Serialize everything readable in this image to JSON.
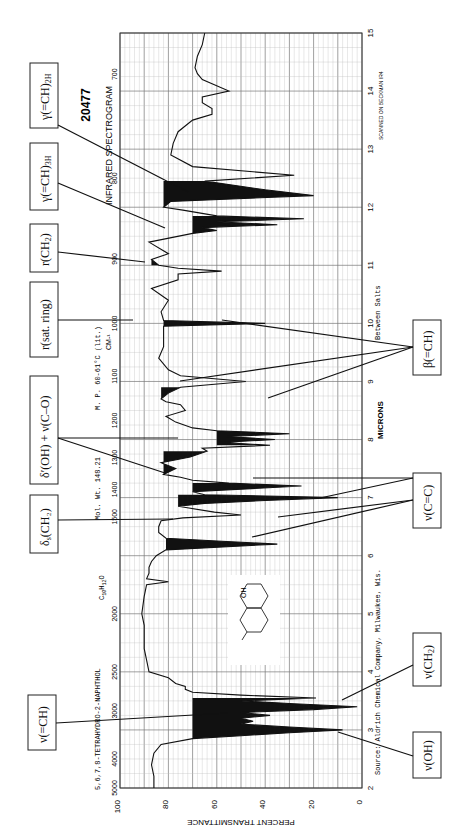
{
  "chart_data": {
    "type": "line",
    "title": "INFRARED SPECTROGRAM",
    "spectrum_id": "20477",
    "compound": "5,6,7,8-TETRAHYDRO-2-NAPHTHOL",
    "formula": "C10H12O",
    "mol_wt": "Mol. Wt. 148.21",
    "melting_point": "M. P. 60-61°C (lit.)",
    "source": "Source: Aldrich Chemical Company, Milwaukee, Wis.",
    "sampling": "Between Salts",
    "instrument": "SCANNED ON BECKMAN IR4",
    "xlabel": "MICRONS",
    "x2label": "CM-1",
    "ylabel": "PERCENT TRANSMITTANCE",
    "orientation": "rotated 90° counter-clockwise",
    "xlim_microns": [
      2,
      15
    ],
    "ylim": [
      0,
      100
    ],
    "grid": true,
    "micron_ticks": [
      2,
      3,
      4,
      5,
      6,
      7,
      8,
      9,
      10,
      11,
      12,
      13,
      14,
      15
    ],
    "wavenumber_ticks": [
      5000,
      4000,
      3000,
      2500,
      2000,
      1500,
      1400,
      1300,
      1200,
      1100,
      1000,
      900,
      800,
      700
    ],
    "transmittance_ticks": [
      0,
      20,
      40,
      60,
      80,
      100
    ],
    "series": [
      {
        "name": "transmittance",
        "x_microns": [
          2.0,
          2.2,
          2.4,
          2.6,
          2.75,
          2.85,
          2.9,
          2.95,
          3.0,
          3.05,
          3.1,
          3.15,
          3.2,
          3.25,
          3.3,
          3.35,
          3.4,
          3.45,
          3.5,
          3.55,
          3.6,
          3.65,
          3.7,
          3.75,
          3.8,
          3.9,
          4.0,
          4.2,
          4.4,
          4.6,
          4.8,
          5.0,
          5.3,
          5.5,
          5.55,
          5.6,
          5.7,
          5.8,
          5.9,
          6.0,
          6.1,
          6.2,
          6.25,
          6.3,
          6.4,
          6.5,
          6.6,
          6.65,
          6.7,
          6.75,
          6.85,
          6.9,
          6.95,
          7.0,
          7.05,
          7.1,
          7.2,
          7.25,
          7.3,
          7.35,
          7.4,
          7.5,
          7.6,
          7.7,
          7.8,
          7.85,
          7.9,
          7.95,
          8.0,
          8.05,
          8.1,
          8.15,
          8.2,
          8.3,
          8.4,
          8.5,
          8.6,
          8.65,
          8.7,
          8.8,
          8.9,
          9.0,
          9.1,
          9.2,
          9.4,
          9.6,
          9.8,
          9.95,
          10.0,
          10.05,
          10.2,
          10.4,
          10.6,
          10.75,
          10.85,
          10.9,
          10.95,
          11.0,
          11.1,
          11.2,
          11.4,
          11.55,
          11.6,
          11.65,
          11.7,
          11.75,
          11.8,
          11.85,
          11.95,
          12.0,
          12.1,
          12.2,
          12.3,
          12.45,
          12.55,
          12.7,
          12.9,
          13.1,
          13.3,
          13.5,
          13.6,
          13.7,
          13.8,
          13.9,
          14.0,
          14.2,
          14.3,
          14.4,
          14.6,
          14.8,
          15.0
        ],
        "y_percent": [
          86,
          86,
          87,
          86,
          83,
          70,
          50,
          30,
          8,
          30,
          50,
          45,
          50,
          38,
          50,
          20,
          2,
          28,
          50,
          19,
          50,
          70,
          73,
          73,
          77,
          80,
          88,
          89,
          90,
          90,
          90,
          91,
          90,
          89,
          80,
          89,
          88,
          88,
          87,
          85,
          81,
          35,
          58,
          81,
          84,
          84,
          83,
          74,
          50,
          61,
          76,
          65,
          40,
          10,
          65,
          70,
          25,
          55,
          70,
          75,
          82,
          77,
          83,
          71,
          64,
          66,
          38,
          58,
          36,
          56,
          30,
          60,
          70,
          77,
          81,
          73,
          75,
          81,
          83,
          80,
          75,
          48,
          75,
          80,
          84,
          82,
          82,
          82,
          40,
          82,
          83,
          80,
          87,
          76,
          76,
          58,
          76,
          84,
          87,
          80,
          88,
          70,
          60,
          66,
          35,
          60,
          24,
          60,
          74,
          82,
          79,
          20,
          40,
          65,
          28,
          70,
          79,
          78,
          76,
          70,
          62,
          62,
          66,
          66,
          55,
          66,
          68,
          69,
          68,
          66,
          65
        ]
      }
    ],
    "filled_bands_microns": [
      [
        2.85,
        3.55
      ],
      [
        6.1,
        6.35
      ],
      [
        6.8,
        7.05
      ],
      [
        7.1,
        7.25
      ],
      [
        7.4,
        7.8
      ],
      [
        7.9,
        8.15
      ],
      [
        8.7,
        8.9
      ],
      [
        9.3,
        9.45
      ],
      [
        9.95,
        10.05
      ],
      [
        11.0,
        11.1
      ],
      [
        11.55,
        11.85
      ],
      [
        12.0,
        12.45
      ]
    ],
    "annotations": [
      {
        "label": "γ(=CH)2H",
        "side": "left",
        "target_micron": 12.1
      },
      {
        "label": "γ(=CH)3H",
        "side": "left",
        "target_micron": 11.65
      },
      {
        "label": "r(CH2)",
        "side": "left",
        "target_micron": 11.05
      },
      {
        "label": "r(sat. ring)",
        "side": "left",
        "target_micron": 10.0
      },
      {
        "label": "δ′(OH) + ν(C–O)",
        "side": "left",
        "target_microns": [
          7.95,
          7.4
        ]
      },
      {
        "label": "δs(CH2)",
        "side": "left",
        "target_micron": 6.9
      },
      {
        "label": "ν(=CH)",
        "side": "left",
        "target_micron": 3.3
      },
      {
        "label": "β(=CH)",
        "side": "right",
        "target_microns": [
          10.0,
          9.05,
          8.75
        ]
      },
      {
        "label": "ν(C=C)",
        "side": "right",
        "target_microns": [
          7.35,
          6.95,
          6.7,
          6.2
        ]
      },
      {
        "label": "ν(CH2)",
        "side": "right",
        "target_micron": 3.5
      },
      {
        "label": "ν(OH)",
        "side": "right",
        "target_micron": 2.95
      }
    ]
  },
  "labels": {
    "spectrum_id": "20477",
    "title": "INFRARED SPECTROGRAM",
    "compound": "5,6,7,8-TETRAHYDRO-2-NAPHTHOL",
    "formula_main": "C",
    "formula_sub1": "10",
    "formula_mid": "H",
    "formula_sub2": "12",
    "formula_end": "O",
    "mol_wt": "Mol. Wt. 148.21",
    "mp": "M. P. 60-61°C  (lit.)",
    "cm_unit": "CM-¹",
    "source": "Source: Aldrich Chemical Company, Milwaukee, Wis.",
    "sampling": "Between Salts",
    "instrument": "SCANNED ON BECKMAN IR4",
    "microns": "MICRONS",
    "ylabel": "PERCENT TRANSMITTANCE",
    "structure_oh": "OH"
  },
  "boxes": {
    "gamma2h": {
      "main": "γ(=CH)",
      "sub": "2H"
    },
    "gamma3h": {
      "main": "γ(=CH)",
      "sub": "3H"
    },
    "rch2": {
      "main": "r(CH",
      "sub": "2",
      "end": ")"
    },
    "rsat": {
      "main": "r(sat. ring)"
    },
    "delta_oh": {
      "main": "δ′(OH) + ν(C–O)"
    },
    "delta_s": {
      "main": "δ",
      "sub": "s",
      "end": "(CH₂)"
    },
    "nu_ch": {
      "main": "ν(=CH)"
    },
    "beta": {
      "main": "β(=CH)"
    },
    "nu_cc": {
      "main": "ν(C=C)"
    },
    "nu_ch2": {
      "main": "ν(CH",
      "sub": "2",
      "end": ")"
    },
    "nu_oh": {
      "main": "ν(OH)"
    }
  }
}
